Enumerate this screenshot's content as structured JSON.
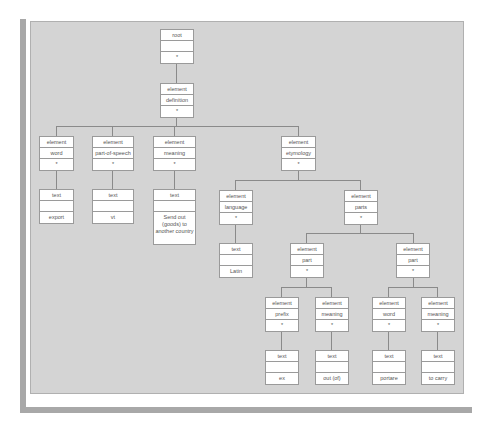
{
  "diagram": {
    "nodes": {
      "root": {
        "type": "root",
        "name": "",
        "value": "*"
      },
      "definition": {
        "type": "element",
        "name": "definition",
        "value": "*"
      },
      "word": {
        "type": "element",
        "name": "word",
        "value": "*"
      },
      "pos": {
        "type": "element",
        "name": "part-of-speech",
        "value": "*"
      },
      "meaning": {
        "type": "element",
        "name": "meaning",
        "value": "*"
      },
      "etymology": {
        "type": "element",
        "name": "etymology",
        "value": "*"
      },
      "text_export": {
        "type": "text",
        "name": "",
        "value": "export"
      },
      "text_vt": {
        "type": "text",
        "name": "",
        "value": "vt"
      },
      "text_sendout": {
        "type": "text",
        "name": "",
        "value": "Send out (goods) to another country"
      },
      "language": {
        "type": "element",
        "name": "language",
        "value": "*"
      },
      "parts": {
        "type": "element",
        "name": "parts",
        "value": "*"
      },
      "text_latin": {
        "type": "text",
        "name": "",
        "value": "Latin"
      },
      "part1": {
        "type": "element",
        "name": "part",
        "value": "*"
      },
      "part2": {
        "type": "element",
        "name": "part",
        "value": "*"
      },
      "prefix": {
        "type": "element",
        "name": "prefix",
        "value": "*"
      },
      "meaning1": {
        "type": "element",
        "name": "meaning",
        "value": "*"
      },
      "word2": {
        "type": "element",
        "name": "word",
        "value": "*"
      },
      "meaning2": {
        "type": "element",
        "name": "meaning",
        "value": "*"
      },
      "text_ex": {
        "type": "text",
        "name": "",
        "value": "ex"
      },
      "text_outof": {
        "type": "text",
        "name": "",
        "value": "out (of)"
      },
      "text_portare": {
        "type": "text",
        "name": "",
        "value": "portare"
      },
      "text_tocarry": {
        "type": "text",
        "name": "",
        "value": "to carry"
      }
    },
    "edges": [
      [
        "root",
        "definition"
      ],
      [
        "definition",
        "word"
      ],
      [
        "definition",
        "pos"
      ],
      [
        "definition",
        "meaning"
      ],
      [
        "definition",
        "etymology"
      ],
      [
        "word",
        "text_export"
      ],
      [
        "pos",
        "text_vt"
      ],
      [
        "meaning",
        "text_sendout"
      ],
      [
        "etymology",
        "language"
      ],
      [
        "etymology",
        "parts"
      ],
      [
        "language",
        "text_latin"
      ],
      [
        "parts",
        "part1"
      ],
      [
        "parts",
        "part2"
      ],
      [
        "part1",
        "prefix"
      ],
      [
        "part1",
        "meaning1"
      ],
      [
        "part2",
        "word2"
      ],
      [
        "part2",
        "meaning2"
      ],
      [
        "prefix",
        "text_ex"
      ],
      [
        "meaning1",
        "text_outof"
      ],
      [
        "word2",
        "text_portare"
      ],
      [
        "meaning2",
        "text_tocarry"
      ]
    ]
  }
}
